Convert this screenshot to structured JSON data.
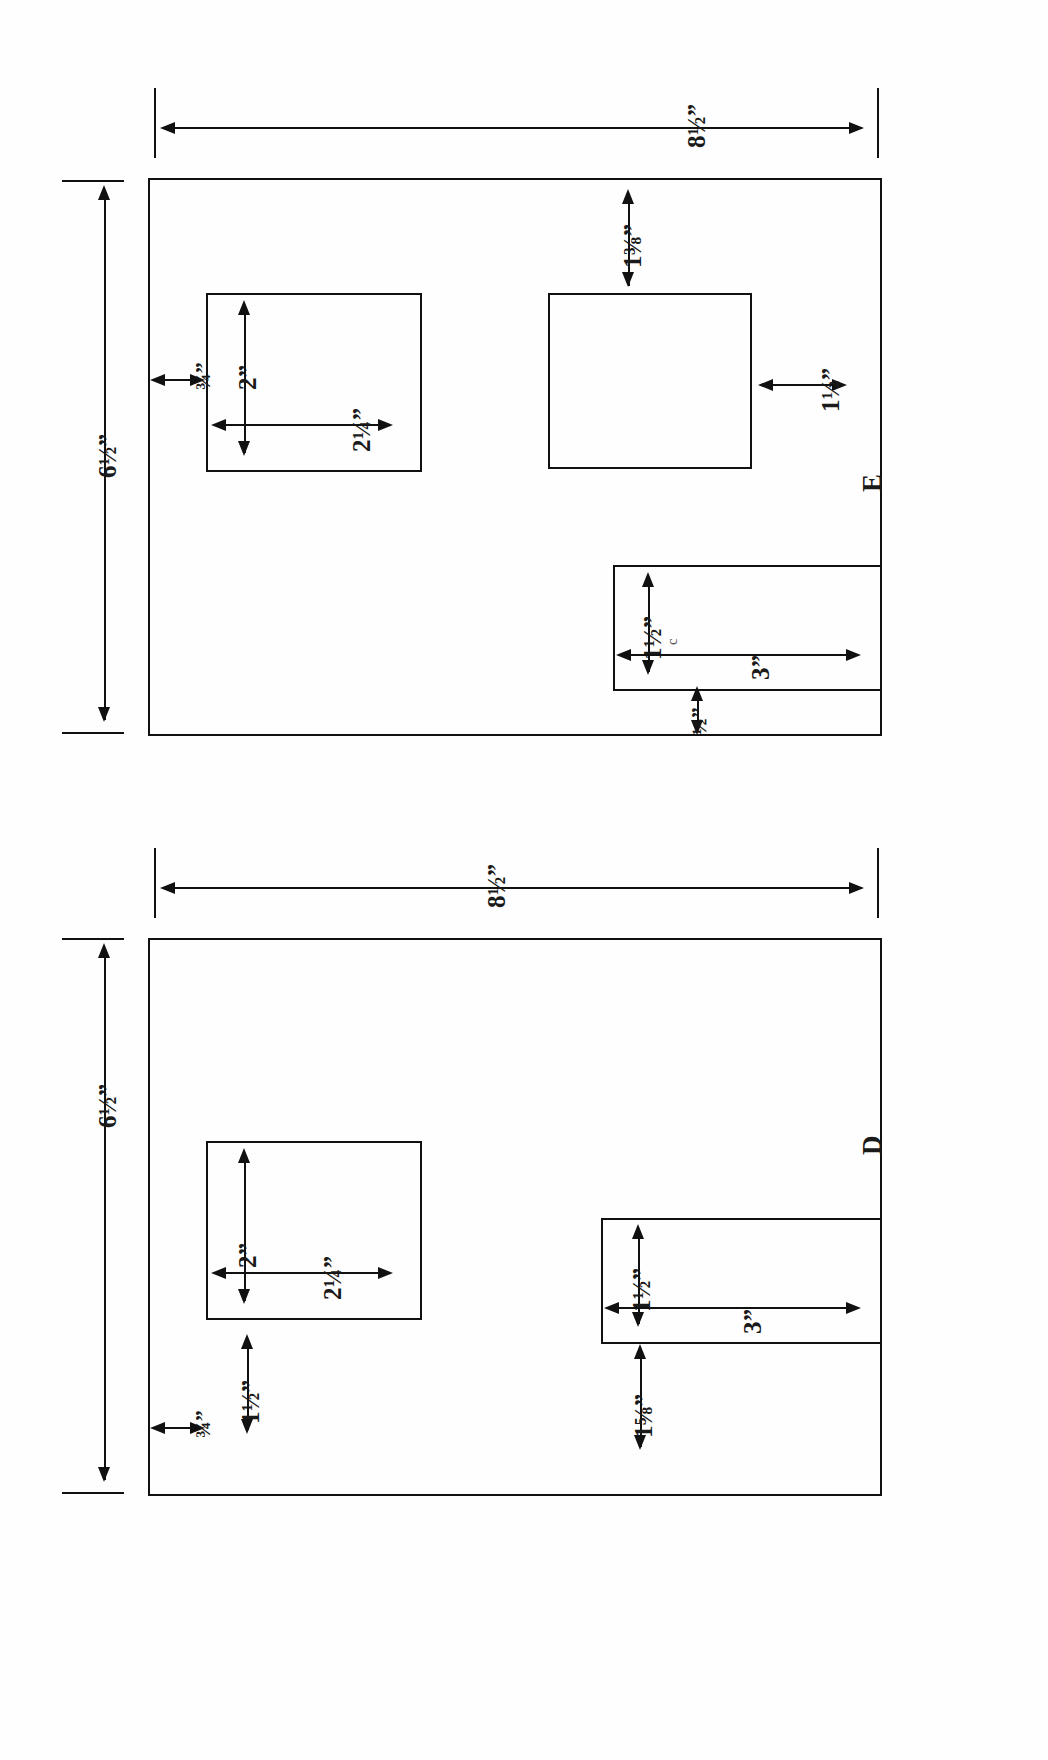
{
  "document": {
    "type": "technical-drawing",
    "description": "Two pocket-placement layout diagrams for fabric panels, printed sideways on the page",
    "orientation": "rotated-90-ccw",
    "background_color": "#ffffff",
    "line_color": "#111111"
  },
  "figures": [
    {
      "id": "E",
      "label": "E",
      "panel": {
        "width_label": "8½”",
        "height_label": "6½”"
      },
      "pockets": [
        {
          "name": "upper-square-pocket",
          "width_label": "2¼”",
          "height_label": "2”",
          "edge_offset_label": "¾”"
        },
        {
          "name": "lower-square-pocket",
          "top_offset_label": "1⅜”",
          "side_offset_label": "1½”"
        },
        {
          "name": "wide-rectangle-pocket",
          "width_label": "3”",
          "height_label": "1½”",
          "edge_offset_label": "½”"
        }
      ],
      "stray_mark": "c"
    },
    {
      "id": "D",
      "label": "D",
      "panel": {
        "width_label": "8½”",
        "height_label": "6½”"
      },
      "pockets": [
        {
          "name": "square-pocket",
          "width_label": "2¼”",
          "height_label": "2”",
          "edge_offset_label": "¾”",
          "bottom_offset_label": "1½”"
        },
        {
          "name": "wide-rectangle-pocket",
          "width_label": "3”",
          "height_label": "1½”",
          "edge_offset_label": "1⅝”"
        }
      ]
    }
  ],
  "dimensions": {
    "e_panel_width": "8½”",
    "e_panel_height": "6½”",
    "e_pocket_offset_top": "¾”",
    "e_pocket_height": "2”",
    "e_pocket_width": "2¼”",
    "e_lower_top_gap": "1⅜”",
    "e_lower_side_gap": "1½”",
    "e_rect_height": "1½”",
    "e_rect_width": "3”",
    "e_rect_edge_gap": "½”",
    "e_figure_letter": "E",
    "e_stray": "c",
    "d_panel_width": "8½”",
    "d_panel_height": "6½”",
    "d_pocket_offset_top": "¾”",
    "d_pocket_height": "2”",
    "d_pocket_width": "2¼”",
    "d_pocket_bottom_gap": "1½”",
    "d_rect_height": "1½”",
    "d_rect_width": "3”",
    "d_rect_edge_gap": "1⅝”",
    "d_figure_letter": "D"
  }
}
